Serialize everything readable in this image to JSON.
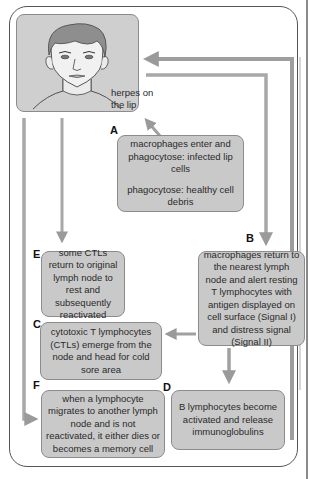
{
  "diagram": {
    "face_label": "herpes on the lip",
    "nodes": [
      {
        "id": "A",
        "letter": "A",
        "lines": [
          "macrophages enter and phagocytose: infected lip cells",
          "phagocytose: healthy cell debris"
        ]
      },
      {
        "id": "B",
        "letter": "B",
        "lines": [
          "macrophages return to the nearest lymph node and alert resting T lymphocytes with antigen displayed on cell surface (Signal I) and distress signal (Signal II)"
        ]
      },
      {
        "id": "C",
        "letter": "C",
        "lines": [
          "cytotoxic T lymphocytes (CTLs) emerge from the node and head for cold sore area"
        ]
      },
      {
        "id": "D",
        "letter": "D",
        "lines": [
          "B lymphocytes become activated and release immunoglobulins"
        ]
      },
      {
        "id": "E",
        "letter": "E",
        "lines": [
          "some CTLs return to original lymph node to rest and subsequently reactivated"
        ]
      },
      {
        "id": "F",
        "letter": "F",
        "lines": [
          "when a lymphocyte migrates to another lymph node and is not reactivated, it either dies or becomes a memory cell"
        ]
      }
    ],
    "edges": [
      {
        "from": "A",
        "to": "face"
      },
      {
        "from": "face",
        "to": "B"
      },
      {
        "from": "B",
        "to": "C"
      },
      {
        "from": "B",
        "to": "D"
      },
      {
        "from": "D",
        "to": "face"
      },
      {
        "from": "face",
        "to": "E"
      },
      {
        "from": "face",
        "to": "F"
      }
    ],
    "colors": {
      "box_fill": "#c9c9c9",
      "box_border": "#8c8c8c",
      "arrow": "#9a9a9a",
      "frame": "#555555"
    }
  }
}
